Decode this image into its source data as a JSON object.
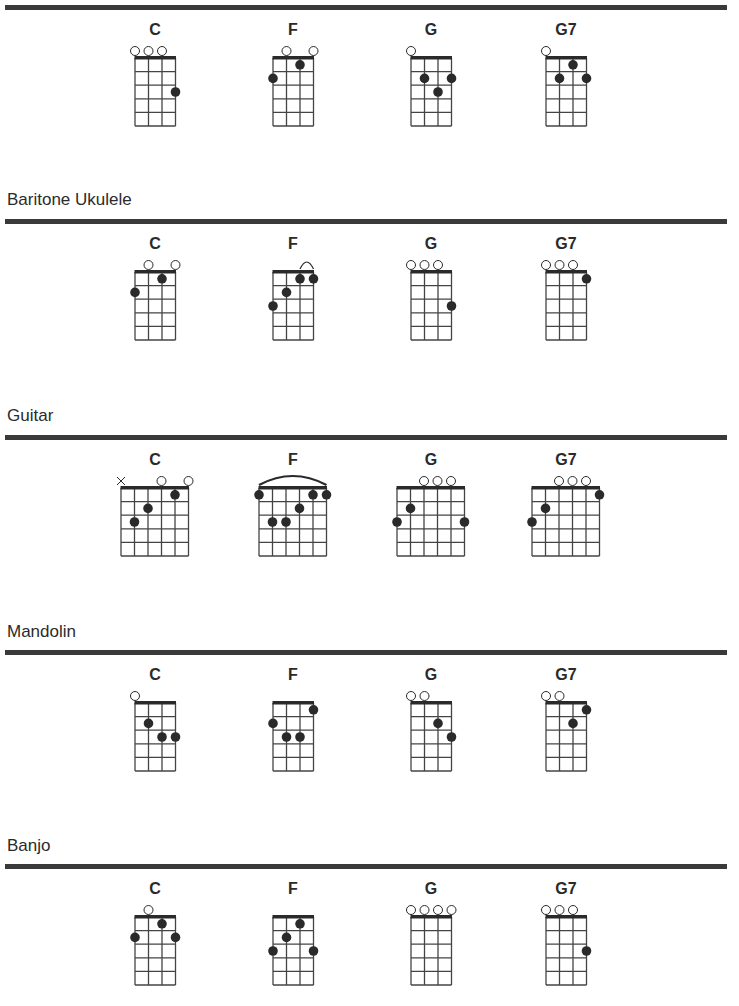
{
  "sections": [
    {
      "instrument": "",
      "label_y": null,
      "rule_y": 5,
      "strings": 4,
      "chords": [
        {
          "name": "C",
          "open": [
            0,
            1,
            2
          ],
          "muted": [],
          "dots": [
            [
              3,
              3
            ]
          ],
          "barre": null
        },
        {
          "name": "F",
          "open": [
            1,
            3
          ],
          "muted": [],
          "dots": [
            [
              2,
              1
            ],
            [
              0,
              2
            ]
          ],
          "barre": null
        },
        {
          "name": "G",
          "open": [
            0
          ],
          "muted": [],
          "dots": [
            [
              1,
              2
            ],
            [
              3,
              2
            ],
            [
              2,
              3
            ]
          ],
          "barre": null
        },
        {
          "name": "G7",
          "open": [
            0
          ],
          "muted": [],
          "dots": [
            [
              2,
              1
            ],
            [
              1,
              2
            ],
            [
              3,
              2
            ]
          ],
          "barre": null
        }
      ]
    },
    {
      "instrument": "Baritone Ukulele",
      "label_y": 190,
      "rule_y": 219,
      "strings": 4,
      "chords": [
        {
          "name": "C",
          "open": [
            1,
            3
          ],
          "muted": [],
          "dots": [
            [
              2,
              1
            ],
            [
              0,
              2
            ]
          ],
          "barre": null
        },
        {
          "name": "F",
          "open": [],
          "muted": [],
          "dots": [
            [
              2,
              1
            ],
            [
              3,
              1
            ],
            [
              1,
              2
            ],
            [
              0,
              3
            ]
          ],
          "barre": [
            2,
            3
          ]
        },
        {
          "name": "G",
          "open": [
            0,
            1,
            2
          ],
          "muted": [],
          "dots": [
            [
              3,
              3
            ]
          ],
          "barre": null
        },
        {
          "name": "G7",
          "open": [
            0,
            1,
            2
          ],
          "muted": [],
          "dots": [
            [
              3,
              1
            ]
          ],
          "barre": null
        }
      ]
    },
    {
      "instrument": "Guitar",
      "label_y": 406,
      "rule_y": 435,
      "strings": 6,
      "chords": [
        {
          "name": "C",
          "open": [
            3,
            5
          ],
          "muted": [
            0
          ],
          "dots": [
            [
              4,
              1
            ],
            [
              2,
              2
            ],
            [
              1,
              3
            ]
          ],
          "barre": null
        },
        {
          "name": "F",
          "open": [],
          "muted": [],
          "dots": [
            [
              0,
              1
            ],
            [
              4,
              1
            ],
            [
              5,
              1
            ],
            [
              3,
              2
            ],
            [
              1,
              3
            ],
            [
              2,
              3
            ]
          ],
          "barre": [
            0,
            5
          ]
        },
        {
          "name": "G",
          "open": [
            2,
            3,
            4
          ],
          "muted": [],
          "dots": [
            [
              1,
              2
            ],
            [
              0,
              3
            ],
            [
              5,
              3
            ]
          ],
          "barre": null
        },
        {
          "name": "G7",
          "open": [
            2,
            3,
            4
          ],
          "muted": [],
          "dots": [
            [
              5,
              1
            ],
            [
              1,
              2
            ],
            [
              0,
              3
            ]
          ],
          "barre": null
        }
      ]
    },
    {
      "instrument": "Mandolin",
      "label_y": 622,
      "rule_y": 650,
      "strings": 4,
      "chords": [
        {
          "name": "C",
          "open": [
            0
          ],
          "muted": [],
          "dots": [
            [
              1,
              2
            ],
            [
              2,
              3
            ],
            [
              3,
              3
            ]
          ],
          "barre": null
        },
        {
          "name": "F",
          "open": [],
          "muted": [],
          "dots": [
            [
              3,
              1
            ],
            [
              0,
              2
            ],
            [
              1,
              3
            ],
            [
              2,
              3
            ]
          ],
          "barre": null
        },
        {
          "name": "G",
          "open": [
            0,
            1
          ],
          "muted": [],
          "dots": [
            [
              2,
              2
            ],
            [
              3,
              3
            ]
          ],
          "barre": null
        },
        {
          "name": "G7",
          "open": [
            0,
            1
          ],
          "muted": [],
          "dots": [
            [
              3,
              1
            ],
            [
              2,
              2
            ]
          ],
          "barre": null
        }
      ]
    },
    {
      "instrument": "Banjo",
      "label_y": 836,
      "rule_y": 864,
      "strings": 4,
      "chords": [
        {
          "name": "C",
          "open": [
            1
          ],
          "muted": [],
          "dots": [
            [
              2,
              1
            ],
            [
              0,
              2
            ],
            [
              3,
              2
            ]
          ],
          "barre": null
        },
        {
          "name": "F",
          "open": [],
          "muted": [],
          "dots": [
            [
              2,
              1
            ],
            [
              1,
              2
            ],
            [
              0,
              3
            ],
            [
              3,
              3
            ]
          ],
          "barre": null
        },
        {
          "name": "G",
          "open": [
            0,
            1,
            2,
            3
          ],
          "muted": [],
          "dots": [],
          "barre": null
        },
        {
          "name": "G7",
          "open": [
            0,
            1,
            2
          ],
          "muted": [],
          "dots": [
            [
              3,
              3
            ]
          ],
          "barre": null
        }
      ]
    }
  ],
  "layout": {
    "chord_centers_x": [
      155,
      293,
      431,
      566
    ],
    "string_spacing": 13.5,
    "fret_spacing": 13.6,
    "frets": 5,
    "ink_color": "#2a2a2a",
    "grid_color": "#444444"
  }
}
